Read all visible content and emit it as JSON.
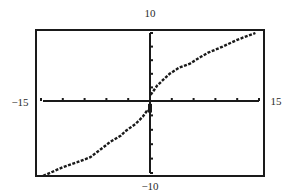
{
  "chart_data": {
    "type": "line",
    "title": "",
    "xlabel": "",
    "ylabel": "",
    "xlim": [
      -15,
      15
    ],
    "ylim": [
      -10,
      10
    ],
    "grid": false,
    "legend": null,
    "x_tick_step": 3,
    "y_tick_step": 2,
    "window_labels": {
      "xmin": "−15",
      "xmax": "15",
      "ymin": "−10",
      "ymax": "10"
    },
    "series": [
      {
        "name": "f(x)",
        "style": "dotted-pixel",
        "x": [
          -14.7,
          -12,
          -10,
          -8.2,
          -6,
          -5.5,
          -4,
          -3.4,
          -2,
          -1,
          -0.3,
          0,
          0.1,
          1,
          2,
          2.7,
          4,
          5.5,
          7,
          8,
          10,
          12,
          14.5
        ],
        "y": [
          -10.4,
          -9.2,
          -8.5,
          -7.8,
          -6.1,
          -5.7,
          -4.8,
          -4.2,
          -3.2,
          -2.2,
          -1.2,
          -1.5,
          0.9,
          2.3,
          3.3,
          4.0,
          4.9,
          5.5,
          6.5,
          7.1,
          8.0,
          9.0,
          10.0
        ]
      }
    ]
  },
  "colors": {
    "ink": "#1a1a1a",
    "background": "#ffffff"
  }
}
